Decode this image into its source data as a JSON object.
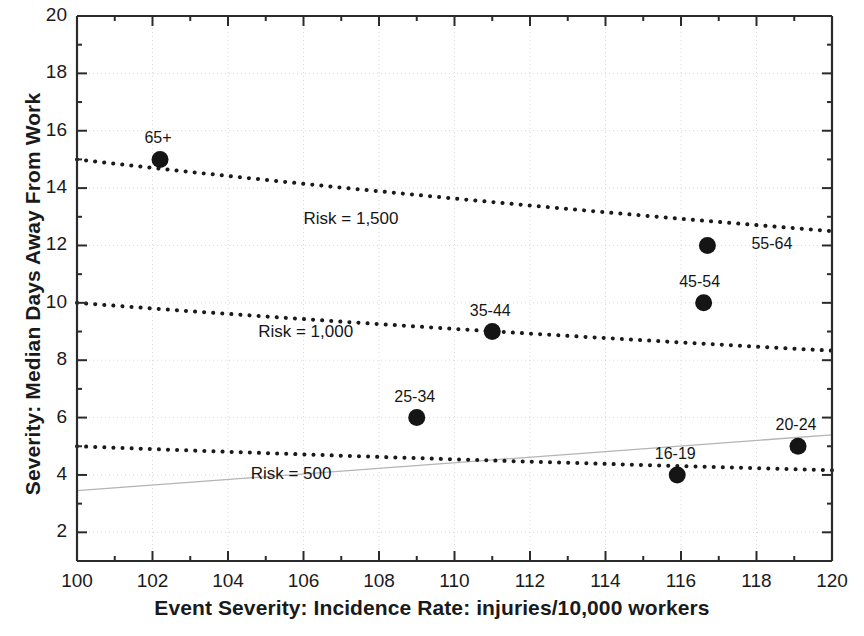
{
  "chart_data": {
    "type": "scatter",
    "title": "",
    "xlabel": "Event Severity: Incidence Rate: injuries/10,000 workers",
    "ylabel": "Severity: Median Days Away From Work",
    "xlim": [
      100,
      120
    ],
    "ylim": [
      1,
      20
    ],
    "x_ticks": [
      100,
      102,
      104,
      106,
      108,
      110,
      112,
      114,
      116,
      118,
      120
    ],
    "y_ticks": [
      2,
      4,
      6,
      8,
      10,
      12,
      14,
      16,
      18,
      20
    ],
    "x_minor_tick_step": 1,
    "y_minor_tick_step": 1,
    "grid": true,
    "legend": "none",
    "points": [
      {
        "label": "65+",
        "x": 102.2,
        "y": 15,
        "label_dx": -2,
        "label_dy": -20,
        "label_align": "center"
      },
      {
        "label": "25-34",
        "x": 109.0,
        "y": 6,
        "label_dx": -2,
        "label_dy": -20,
        "label_align": "center"
      },
      {
        "label": "35-44",
        "x": 111.0,
        "y": 9,
        "label_dx": -2,
        "label_dy": -20,
        "label_align": "center"
      },
      {
        "label": "16-19",
        "x": 115.9,
        "y": 4,
        "label_dx": -2,
        "label_dy": -20,
        "label_align": "center"
      },
      {
        "label": "45-54",
        "x": 116.6,
        "y": 10,
        "label_dx": -4,
        "label_dy": -20,
        "label_align": "center"
      },
      {
        "label": "55-64",
        "x": 116.7,
        "y": 12,
        "label_dx": 44,
        "label_dy": 0,
        "label_align": "left"
      },
      {
        "label": "20-24",
        "x": 119.1,
        "y": 5,
        "label_dx": -2,
        "label_dy": -20,
        "label_align": "center"
      }
    ],
    "iso_risk_curves": [
      {
        "name": "Risk = 1,500",
        "risk": 1500,
        "label_x": 106.0,
        "label_y": 12.9
      },
      {
        "name": "Risk = 1,000",
        "risk": 1000,
        "label_x": 104.8,
        "label_y": 8.95
      },
      {
        "name": "Risk = 500",
        "risk": 500,
        "label_x": 104.6,
        "label_y": 4.0
      }
    ],
    "trend_line": {
      "name": "trend",
      "x1": 100.0,
      "y1": 3.45,
      "x2": 120.0,
      "y2": 5.4,
      "style": "thin-solid-gray"
    },
    "marker": {
      "shape": "circle",
      "color": "#151515",
      "size_px": 17
    },
    "curve_style": {
      "color": "#1a1a1a",
      "dash": "dotted",
      "width_px": 4
    }
  },
  "axis": {
    "x_title": "Event Severity: Incidence Rate: injuries/10,000 workers",
    "y_title": "Severity: Median Days Away From Work",
    "x_tick_labels": [
      "100",
      "102",
      "104",
      "106",
      "108",
      "110",
      "112",
      "114",
      "116",
      "118",
      "120"
    ],
    "y_tick_labels": [
      "2",
      "4",
      "6",
      "8",
      "10",
      "12",
      "14",
      "16",
      "18",
      "20"
    ]
  },
  "colors": {
    "background": "#ffffff",
    "axis": "#2b2b2b",
    "grid": "#d9d9d9",
    "marker": "#151515",
    "curve": "#1a1a1a",
    "trend": "#b4b4b4",
    "text": "#1a1a1a"
  }
}
